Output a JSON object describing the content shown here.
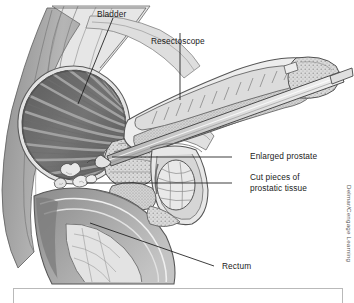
{
  "figure": {
    "background_color": "#ffffff",
    "line_color": "#1b1b1b",
    "palette": {
      "outline": "#4a4a4a",
      "tissue_light": "#e8e8e8",
      "tissue_mid": "#c6c6c6",
      "tissue_dark": "#9a9a9a",
      "bladder_interior": "#6d6d6d",
      "bladder_rugae": "#8e8e8e",
      "body_wall": "#a9a9a9",
      "instrument": "#d8d8d8"
    }
  },
  "labels": [
    {
      "id": "bladder",
      "text": "Bladder",
      "line2": ""
    },
    {
      "id": "resectoscope",
      "text": "Resectoscope",
      "line2": ""
    },
    {
      "id": "enlarged-prostate",
      "text": "Enlarged prostate",
      "line2": ""
    },
    {
      "id": "cut-pieces",
      "text": "Cut pieces of",
      "line2": "prostatic tissue"
    },
    {
      "id": "rectum",
      "text": "Rectum",
      "line2": ""
    }
  ],
  "credit": {
    "text": "Delmar/Cengage Learning"
  }
}
